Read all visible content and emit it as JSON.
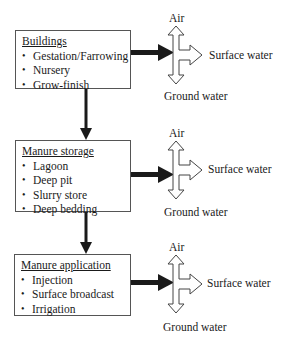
{
  "diagram": {
    "type": "flowchart",
    "stages": [
      {
        "id": "buildings",
        "title": "Buildings",
        "items": [
          "Gestation/Farrowing",
          "Nursery",
          "Grow-finish"
        ],
        "outputs": {
          "up": "Air",
          "right": "Surface water",
          "down": "Ground water"
        }
      },
      {
        "id": "manure-storage",
        "title": "Manure storage",
        "items": [
          "Lagoon",
          "Deep pit",
          "Slurry store",
          "Deep bedding"
        ],
        "outputs": {
          "up": "Air",
          "right": "Surface water",
          "down": "Ground water"
        }
      },
      {
        "id": "manure-application",
        "title": "Manure application",
        "items": [
          "Injection",
          "Surface broadcast",
          "Irrigation"
        ],
        "outputs": {
          "up": "Air",
          "right": "Surface water",
          "down": "Ground water"
        }
      }
    ],
    "edges": [
      {
        "from": "buildings",
        "to": "manure-storage"
      },
      {
        "from": "manure-storage",
        "to": "manure-application"
      }
    ],
    "colors": {
      "arrow_fill": "#1a1a1a",
      "outline": "#444444",
      "box_border": "#555555",
      "background": "#ffffff"
    }
  }
}
